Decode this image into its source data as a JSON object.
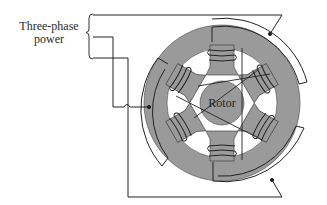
{
  "diagram": {
    "type": "three-phase-motor-schematic",
    "labels": {
      "power_line1": "Three-phase",
      "power_line2": "power",
      "rotor": "Rotor"
    },
    "colors": {
      "stator_fill": "#9a9a9a",
      "rotor_fill": "#9a9a9a",
      "wire": "#222222",
      "background": "#ffffff",
      "coil_fill": "#8c8c8c"
    },
    "components": [
      {
        "name": "three-phase-power-source",
        "inputs": 3
      },
      {
        "name": "stator",
        "poles": 6
      },
      {
        "name": "rotor"
      },
      {
        "name": "phase-connector-arcs",
        "count": 3
      }
    ]
  }
}
